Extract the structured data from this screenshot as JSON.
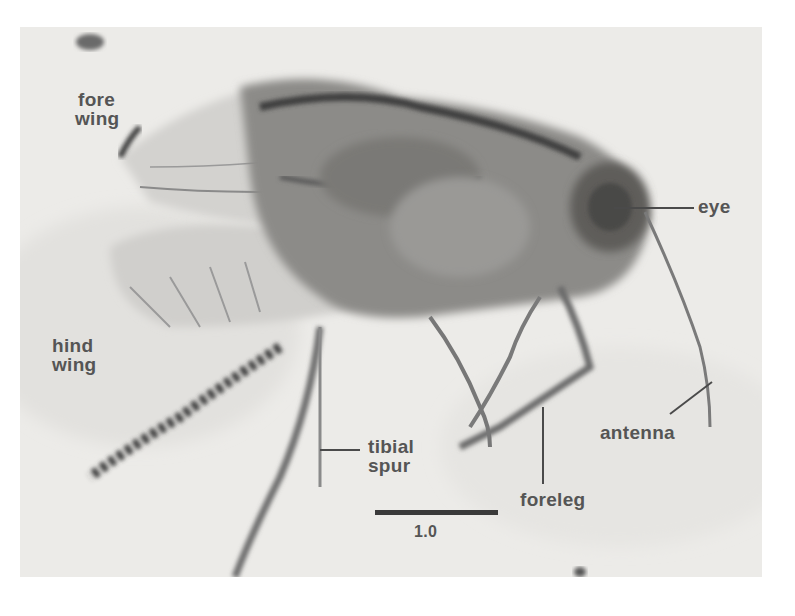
{
  "figure": {
    "labels": {
      "fore_wing": [
        "fore",
        "wing"
      ],
      "hind_wing": [
        "hind",
        "wing"
      ],
      "eye": "eye",
      "tibial_spur": [
        "tibial",
        "spur"
      ],
      "foreleg": "foreleg",
      "antenna": "antenna"
    },
    "scale_bar": {
      "value": "1.0"
    }
  }
}
